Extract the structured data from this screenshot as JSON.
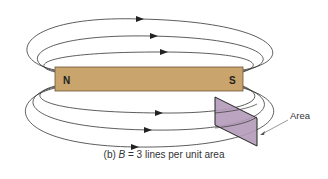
{
  "figure": {
    "magnet": {
      "north_label": "N",
      "south_label": "S",
      "fill_color": "#c9a46c",
      "stroke_color": "#6b5535"
    },
    "area_patch": {
      "label": "Area",
      "fill_color": "#b39ab8"
    },
    "field_lines": {
      "above_count": 3,
      "below_count": 3,
      "color": "#333333"
    },
    "caption": {
      "prefix": "(b) ",
      "symbol": "B",
      "text": " = 3 lines per unit area"
    }
  }
}
